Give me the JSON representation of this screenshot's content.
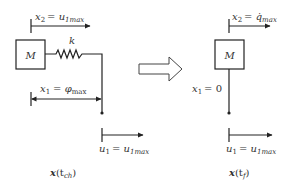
{
  "diagram": {
    "left_state": {
      "mass_label": "M",
      "spring_label": "k",
      "x2_label_var": "x",
      "x2_label_sub": "2",
      "x2_label_rhs": "= u",
      "x2_label_rhs_sub": "1max",
      "x1_label_var": "x",
      "x1_label_sub": "1",
      "x1_label_rhs": "= φ",
      "x1_label_rhs_sub": "max",
      "u1_label_var": "u",
      "u1_label_sub": "1",
      "u1_label_rhs": "= u",
      "u1_label_rhs_sub": "1max",
      "caption_bold": "x",
      "caption_open": "(t",
      "caption_sub": "ch",
      "caption_close": ")"
    },
    "transition_arrow": "hollow-right-arrow",
    "right_state": {
      "mass_label": "M",
      "x2_label_var": "x",
      "x2_label_sub": "2",
      "x2_label_rhs": "= q̇",
      "x2_label_rhs_sub": "max",
      "x1_label_var": "x",
      "x1_label_sub": "1",
      "x1_label_rhs": "= 0",
      "u1_label_var": "u",
      "u1_label_sub": "1",
      "u1_label_rhs": "= u",
      "u1_label_rhs_sub": "1max",
      "caption_bold": "x",
      "caption_open": "(t",
      "caption_sub": "f",
      "caption_close": ")"
    }
  }
}
